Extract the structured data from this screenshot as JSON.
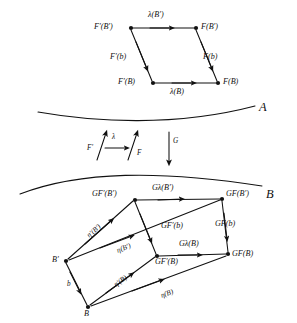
{
  "figure": {
    "type": "commutative-diagram",
    "background": "#ffffff",
    "ink": "#111111",
    "categories": {
      "upper_label": "A",
      "lower_label": "B"
    },
    "upper_square": {
      "name": "lambda-naturality-square",
      "vertices": [
        {
          "id": "Fp_Bp",
          "label": "F′(B′)",
          "x": 131,
          "y": 28
        },
        {
          "id": "F_Bp",
          "label": "F(B′)",
          "x": 196,
          "y": 28
        },
        {
          "id": "Fp_B",
          "label": "F′(B)",
          "x": 153,
          "y": 83
        },
        {
          "id": "F_B",
          "label": "F(B)",
          "x": 218,
          "y": 83
        }
      ],
      "edges": [
        {
          "id": "top",
          "label": "λ(B′)",
          "from": "Fp_Bp",
          "to": "F_Bp"
        },
        {
          "id": "bottom",
          "label": "λ(B)",
          "from": "Fp_B",
          "to": "F_B"
        },
        {
          "id": "left",
          "label": "F′(b)",
          "from": "Fp_Bp",
          "to": "Fp_B"
        },
        {
          "id": "right",
          "label": "F(b)",
          "from": "F_Bp",
          "to": "F_B"
        }
      ]
    },
    "middle_arrows": [
      {
        "id": "Fprime-arrow",
        "label": "F′",
        "direction": "up"
      },
      {
        "id": "lambda-arrow",
        "label": "λ",
        "direction": "right"
      },
      {
        "id": "F-arrow",
        "label": "F",
        "direction": "up"
      },
      {
        "id": "G-arrow",
        "label": "G",
        "direction": "down"
      }
    ],
    "lower_prism": {
      "name": "G-image-prism",
      "vertices": [
        {
          "id": "Bp",
          "label": "B′",
          "x": 66,
          "y": 261
        },
        {
          "id": "B",
          "label": "B",
          "x": 88,
          "y": 307
        },
        {
          "id": "GFp_Bp",
          "label": "GF′(B′)",
          "x": 135,
          "y": 200
        },
        {
          "id": "GFp_B",
          "label": "GF′(B)",
          "x": 157,
          "y": 256
        },
        {
          "id": "GF_Bp",
          "label": "GF(B′)",
          "x": 222,
          "y": 199
        },
        {
          "id": "GF_B",
          "label": "GF(B)",
          "x": 228,
          "y": 254
        }
      ],
      "edges": [
        {
          "id": "gl-top",
          "label": "Gλ(B′)",
          "from": "GFp_Bp",
          "to": "GF_Bp"
        },
        {
          "id": "gl-bottom",
          "label": "Gλ(B)",
          "from": "GFp_B",
          "to": "GF_B"
        },
        {
          "id": "gfpb",
          "label": "GF′(b)",
          "from": "GFp_Bp",
          "to": "GFp_B"
        },
        {
          "id": "gfb",
          "label": "GF(b)",
          "from": "GF_Bp",
          "to": "GF_B"
        },
        {
          "id": "eta-p-Bp",
          "label": "η′(B′)",
          "from": "Bp",
          "to": "GFp_Bp"
        },
        {
          "id": "eta-Bp",
          "label": "η(B′)",
          "from": "Bp",
          "to": "GF_Bp"
        },
        {
          "id": "eta-p-B",
          "label": "η′(B)",
          "from": "B",
          "to": "GFp_B"
        },
        {
          "id": "eta-B",
          "label": "η(B)",
          "from": "B",
          "to": "GF_B"
        },
        {
          "id": "b-edge",
          "label": "b",
          "from": "Bp",
          "to": "B"
        }
      ]
    }
  }
}
